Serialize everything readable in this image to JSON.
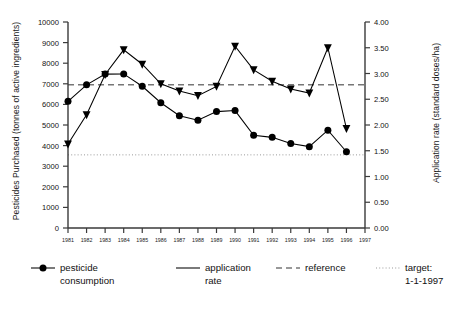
{
  "chart_data": {
    "type": "line",
    "title": "",
    "xlabel": "",
    "ylabel": "Pesticides Purchased (tonnes of active ingredients)",
    "y2label": "Application rate (standard doses/ha)",
    "x": [
      1981,
      1982,
      1983,
      1984,
      1985,
      1986,
      1987,
      1988,
      1989,
      1990,
      1991,
      1992,
      1993,
      1994,
      1995,
      1996
    ],
    "xlim": [
      1981,
      1997
    ],
    "xticks": [
      1981,
      1982,
      1983,
      1984,
      1985,
      1986,
      1987,
      1988,
      1989,
      1990,
      1991,
      1992,
      1993,
      1994,
      1995,
      1996,
      1997
    ],
    "xticklabels": [
      "1981",
      "1982",
      "1983",
      "1984",
      "1985",
      "1986",
      "1987",
      "1988",
      "1989",
      "1990",
      "1991",
      "1992",
      "1993",
      "1994",
      "1995",
      "1996",
      "1997"
    ],
    "ylim": [
      0,
      10000
    ],
    "yticks": [
      0,
      1000,
      2000,
      3000,
      4000,
      5000,
      6000,
      7000,
      8000,
      9000,
      10000
    ],
    "yticklabels": [
      "0",
      "1000",
      "2000",
      "3000",
      "4000",
      "5000",
      "6000",
      "7000",
      "8000",
      "9000",
      "10000"
    ],
    "y2lim": [
      0,
      4.0
    ],
    "y2ticks": [
      0,
      0.5,
      1.0,
      1.5,
      2.0,
      2.5,
      3.0,
      3.5,
      4.0
    ],
    "y2ticklabels": [
      "0.00",
      "0.50",
      "1.00",
      "1.50",
      "2.00",
      "2.50",
      "3.00",
      "3.50",
      "4.00"
    ],
    "grid": false,
    "legend_position": "below",
    "series": [
      {
        "name": "pesticide consumption",
        "axis": "left",
        "marker": "circle",
        "color": "#000000",
        "values": [
          6150,
          6950,
          7470,
          7480,
          6880,
          6080,
          5450,
          5230,
          5650,
          5700,
          4500,
          4400,
          4100,
          3950,
          4750,
          3700
        ]
      },
      {
        "name": "application rate",
        "axis": "right",
        "marker": "triangle-down",
        "color": "#000000",
        "values": [
          1.63,
          2.2,
          2.98,
          3.46,
          3.18,
          2.8,
          2.66,
          2.57,
          2.75,
          3.53,
          3.07,
          2.85,
          2.7,
          2.62,
          3.5,
          1.93
        ]
      }
    ],
    "reference_lines": [
      {
        "name": "reference",
        "style": "dashed",
        "axis": "left",
        "value": 6950,
        "value_right_axis": 2.82,
        "color": "#333333"
      },
      {
        "name": "target: 1-1-1997",
        "style": "dotted",
        "axis": "left",
        "value": 3550,
        "value_right_axis": 1.45,
        "color": "#999999"
      }
    ]
  },
  "axes": {
    "left_title": "Pesticides Purchased (tonnes of active ingredients)",
    "right_title": "Application rate (standard doses/ha)"
  },
  "legend": {
    "items": [
      {
        "key": "pesticide-consumption",
        "line1": "pesticide",
        "line2": "consumption",
        "sample": "line-with-circle-marker"
      },
      {
        "key": "application-rate",
        "line1": "application",
        "line2": "rate",
        "sample": "solid-line"
      },
      {
        "key": "reference",
        "line1": "reference",
        "line2": "",
        "sample": "dashed-line"
      },
      {
        "key": "target",
        "line1": "target:",
        "line2": "1-1-1997",
        "sample": "dotted-line"
      }
    ]
  }
}
